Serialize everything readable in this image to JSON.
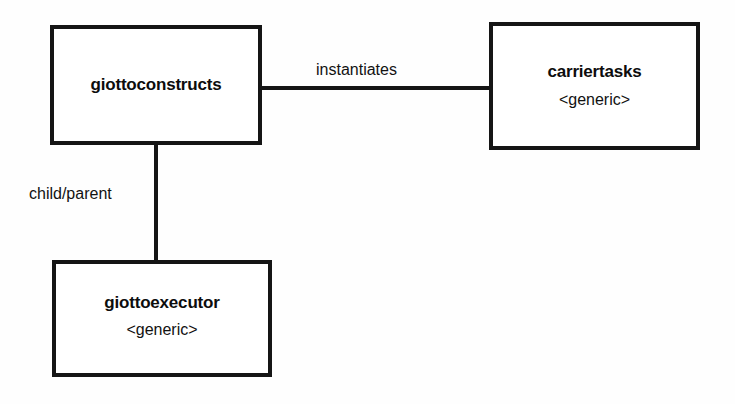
{
  "diagram": {
    "type": "block-diagram",
    "background_color": "#fefefe",
    "line_color": "#151515",
    "text_color": "#0d0d0d",
    "nodes": [
      {
        "id": "giottoconstructs",
        "title": "giottoconstructs",
        "stereotype": "",
        "position": {
          "x": 50,
          "y": 25,
          "width": 212,
          "height": 120
        }
      },
      {
        "id": "carriertasks",
        "title": "carriertasks",
        "stereotype": "<generic>",
        "position": {
          "x": 489,
          "y": 22,
          "width": 211,
          "height": 128
        }
      },
      {
        "id": "giottoexecutor",
        "title": "giottoexecutor",
        "stereotype": "<generic>",
        "position": {
          "x": 52,
          "y": 260,
          "width": 220,
          "height": 117
        }
      }
    ],
    "edges": [
      {
        "id": "instantiates",
        "label": "instantiates",
        "from": "giottoconstructs",
        "to": "carriertasks",
        "orientation": "horizontal"
      },
      {
        "id": "child-parent",
        "label": "child/parent",
        "from": "giottoconstructs",
        "to": "giottoexecutor",
        "orientation": "vertical"
      }
    ]
  }
}
